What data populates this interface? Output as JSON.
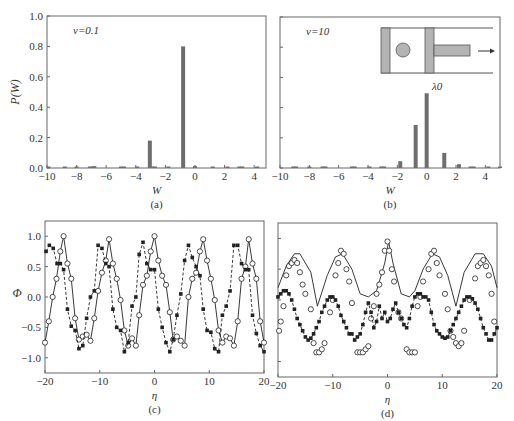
{
  "figure": {
    "panels": [
      "(a)",
      "(b)",
      "(c)",
      "(d)"
    ]
  },
  "chart_data": [
    {
      "id": "a",
      "type": "bar",
      "caption": "(a)",
      "annotation": "ν=0.1",
      "xlabel": "W",
      "ylabel": "P(W)",
      "xlim": [
        -10,
        4.8
      ],
      "ylim": [
        0,
        1.0
      ],
      "xticks": [
        -10,
        -8,
        -6,
        -4,
        -2,
        0,
        2,
        4
      ],
      "yticks": [
        0.0,
        0.2,
        0.4,
        0.6,
        0.8,
        1.0
      ],
      "ytick_labels": [
        "0.0",
        "0.2",
        "0.4",
        "0.6",
        "0.8",
        "1.0"
      ],
      "bar_color": "#6e6e6e",
      "x": [
        -9.9,
        -8.8,
        -8.0,
        -7.1,
        -6.9,
        -6.8,
        -5.0,
        -4.8,
        -3.9,
        -3.05,
        -2.9,
        -2.7,
        -1.8,
        -0.8,
        0.0,
        1.2,
        2.2,
        3.0,
        3.2,
        4.2
      ],
      "values": [
        0.003,
        0.003,
        0.003,
        0.006,
        0.01,
        0.012,
        0.003,
        0.003,
        0.003,
        0.18,
        0.006,
        0.004,
        0.003,
        0.8,
        0.012,
        0.003,
        0.003,
        0.003,
        0.003,
        0.003
      ]
    },
    {
      "id": "b",
      "type": "bar",
      "caption": "(b)",
      "annotation": "ν=10",
      "inset_label": "λ0",
      "xlabel": "W",
      "ylabel": "",
      "xlim": [
        -10,
        5
      ],
      "ylim": [
        0,
        1.0
      ],
      "xticks": [
        -10,
        -8,
        -6,
        -4,
        -2,
        0,
        2,
        4
      ],
      "yticks": [
        0.0,
        0.2,
        0.4,
        0.6,
        0.8,
        1.0
      ],
      "bar_color": "#6e6e6e",
      "x": [
        -9.1,
        -8.9,
        -8.0,
        -7.1,
        -6.9,
        -5.1,
        -4.9,
        -3.9,
        -3.1,
        -2.9,
        -1.8,
        -0.75,
        0.0,
        1.2,
        2.2,
        3.0,
        3.2,
        4.2,
        5.0
      ],
      "values": [
        0.004,
        0.004,
        0.004,
        0.004,
        0.004,
        0.004,
        0.004,
        0.01,
        0.004,
        0.004,
        0.045,
        0.285,
        0.495,
        0.1,
        0.025,
        0.004,
        0.004,
        0.004,
        0.004
      ]
    },
    {
      "id": "c",
      "type": "line",
      "caption": "(c)",
      "xlabel": "η",
      "ylabel": "Φ",
      "xlim": [
        -20,
        20
      ],
      "ylim": [
        -1.25,
        1.25
      ],
      "xticks": [
        -20,
        -10,
        0,
        10,
        20
      ],
      "yticks": [
        -1.0,
        -0.5,
        0.0,
        0.5,
        1.0
      ],
      "ytick_labels": [
        "−1.0",
        "−0.5",
        "0.0",
        "0.5",
        "1.0"
      ],
      "series": [
        {
          "name": "solid-circles",
          "style": "solid",
          "marker": "circle",
          "x": [
            -20,
            -19.3,
            -18.6,
            -17.9,
            -17.2,
            -16.6,
            -15.9,
            -15.2,
            -14.5,
            -13.8,
            -13.1,
            -12.4,
            -11.7,
            -11.0,
            -10.3,
            -9.6,
            -8.9,
            -8.3,
            -7.6,
            -6.9,
            -6.2,
            -5.5,
            -4.8,
            -4.1,
            -3.4,
            -2.8,
            -2.1,
            -1.4,
            -0.7,
            0.0,
            0.7,
            1.4,
            2.1,
            2.8,
            3.4,
            4.1,
            4.8,
            5.5,
            6.2,
            6.9,
            7.6,
            8.3,
            8.9,
            9.6,
            10.3,
            11.0,
            11.7,
            12.4,
            13.1,
            13.8,
            14.5,
            15.2,
            15.9,
            16.6,
            17.2,
            17.9,
            18.6,
            19.3,
            20.0
          ],
          "values": [
            -0.75,
            -0.4,
            0.0,
            0.3,
            0.75,
            1.0,
            0.55,
            0.3,
            -0.35,
            -0.7,
            -0.65,
            -0.62,
            -0.72,
            -0.35,
            0.1,
            0.4,
            0.6,
            0.95,
            0.55,
            0.3,
            -0.05,
            -0.55,
            -0.8,
            -0.68,
            -0.8,
            -0.3,
            0.2,
            0.35,
            0.75,
            1.0,
            0.6,
            0.35,
            0.2,
            -0.25,
            -0.7,
            -0.65,
            -0.72,
            -0.8,
            0.0,
            0.3,
            0.4,
            0.75,
            0.95,
            0.6,
            0.3,
            -0.05,
            -0.55,
            -0.75,
            -0.65,
            -0.68,
            -0.8,
            -0.4,
            0.3,
            0.5,
            0.95,
            0.55,
            0.3,
            -0.4,
            -0.75
          ]
        },
        {
          "name": "dashed-stars",
          "style": "dashed",
          "marker": "star",
          "x": [
            -19.8,
            -19.2,
            -18.5,
            -17.8,
            -17.2,
            -16.6,
            -15.9,
            -15.2,
            -14.5,
            -13.8,
            -13.1,
            -12.4,
            -11.7,
            -11.0,
            -10.3,
            -9.6,
            -8.9,
            -8.3,
            -7.6,
            -6.9,
            -6.2,
            -5.5,
            -4.8,
            -4.1,
            -3.4,
            -2.8,
            -2.1,
            -1.4,
            -0.7,
            0.0,
            0.7,
            1.4,
            2.1,
            2.8,
            3.4,
            4.1,
            4.8,
            5.5,
            6.2,
            6.9,
            7.6,
            8.3,
            8.9,
            9.6,
            10.3,
            11.0,
            11.7,
            12.4,
            13.1,
            13.8,
            14.5,
            15.2,
            15.9,
            16.6,
            17.2,
            17.9,
            18.6,
            19.3,
            20.0
          ],
          "values": [
            0.75,
            0.85,
            0.8,
            0.55,
            0.55,
            0.45,
            -0.2,
            -0.48,
            -0.55,
            -0.85,
            -0.8,
            -0.35,
            0.0,
            0.1,
            0.85,
            0.8,
            0.55,
            0.5,
            -0.2,
            -0.5,
            -0.55,
            -0.9,
            -0.75,
            -0.15,
            0.0,
            0.7,
            0.9,
            0.55,
            0.45,
            0.45,
            -0.2,
            -0.5,
            -0.75,
            -0.9,
            -0.7,
            -0.3,
            0.05,
            0.6,
            0.85,
            0.65,
            0.5,
            0.35,
            -0.2,
            -0.55,
            -0.58,
            -0.85,
            -0.9,
            -0.3,
            -0.15,
            0.1,
            0.85,
            0.85,
            0.55,
            0.45,
            0.45,
            -0.3,
            -0.6,
            -0.8,
            -0.9
          ]
        }
      ]
    },
    {
      "id": "d",
      "type": "line",
      "caption": "(d)",
      "xlabel": "η",
      "ylabel": "",
      "xlim": [
        -20,
        20
      ],
      "ylim": [
        -1.25,
        1.25
      ],
      "xticks": [
        -20,
        -10,
        0,
        10,
        20
      ],
      "yticks": [
        -1.0,
        -0.5,
        0.0,
        0.5,
        1.0
      ],
      "series": [
        {
          "name": "solid-line",
          "style": "solid",
          "marker": "none",
          "x": [
            -20,
            -18.5,
            -17,
            -16,
            -14,
            -12.8,
            -11,
            -9.5,
            -8.2,
            -6.5,
            -5,
            -3.5,
            -2,
            -0.5,
            0.2,
            1,
            2.5,
            4,
            5,
            6.5,
            8.2,
            9.5,
            11,
            12.5,
            14,
            16,
            17.5,
            19,
            20
          ],
          "values": [
            0.2,
            0.55,
            0.75,
            0.75,
            0.45,
            -0.1,
            0.4,
            0.7,
            0.75,
            0.5,
            0.1,
            0.05,
            0.15,
            0.6,
            0.95,
            0.6,
            0.1,
            0.05,
            0.15,
            0.5,
            0.75,
            0.7,
            0.4,
            -0.1,
            0.45,
            0.75,
            0.75,
            0.55,
            0.2
          ]
        },
        {
          "name": "circles",
          "style": "none",
          "marker": "circle",
          "x": [
            -19.8,
            -19.5,
            -19,
            -18.5,
            -18,
            -17.5,
            -17,
            -16.5,
            -16,
            -15.5,
            -15,
            -14,
            -13.5,
            -13,
            -12.5,
            -12,
            -11.5,
            -10.5,
            -10,
            -9.5,
            -9,
            -8.5,
            -8,
            -7.5,
            -7,
            -6.5,
            -5.5,
            -5,
            -4.5,
            -4,
            -3.5,
            -3,
            -2.5,
            -2,
            -1.5,
            -1,
            -0.5,
            0,
            0.3,
            0.8,
            1.2,
            2,
            2.5,
            3.5,
            4,
            4.5,
            5,
            5.5,
            6,
            6.5,
            7.5,
            8,
            8.5,
            9,
            9.5,
            10.5,
            11,
            11.5,
            12,
            12.5,
            13,
            13.5,
            14,
            15,
            16,
            16.5,
            17,
            17.5,
            18,
            18.5,
            19,
            19.5
          ],
          "values": [
            -0.5,
            -0.35,
            -0.1,
            0.4,
            0.55,
            0.6,
            0.65,
            0.6,
            0.45,
            0.25,
            0.1,
            -0.15,
            -0.7,
            -0.85,
            -0.85,
            -0.8,
            -0.7,
            -0.2,
            0.0,
            0.4,
            0.6,
            0.8,
            0.75,
            0.5,
            0.3,
            -0.05,
            -0.85,
            -0.85,
            -0.85,
            -0.8,
            -0.75,
            -0.3,
            -0.1,
            0.1,
            0.25,
            0.45,
            0.8,
            0.95,
            0.8,
            0.5,
            0.3,
            -0.2,
            -0.3,
            -0.8,
            -0.85,
            -0.85,
            -0.85,
            -0.1,
            0.05,
            0.3,
            0.5,
            0.75,
            0.8,
            0.6,
            0.4,
            0.1,
            -0.15,
            -0.5,
            -0.6,
            -0.7,
            -0.75,
            -0.7,
            -0.5,
            0.0,
            0.35,
            0.55,
            0.6,
            0.65,
            0.55,
            0.4,
            0.1,
            -0.35
          ]
        },
        {
          "name": "dashed-stars",
          "style": "dashed",
          "marker": "star",
          "x": [
            -20,
            -19.5,
            -19,
            -18.5,
            -18,
            -17.5,
            -17,
            -16.5,
            -16,
            -15.5,
            -15,
            -14.5,
            -14,
            -13.5,
            -13,
            -12.5,
            -12,
            -11.5,
            -11,
            -10.5,
            -10,
            -9.5,
            -9,
            -8.5,
            -8,
            -7.5,
            -7,
            -6.5,
            -6,
            -5.5,
            -5,
            -4.5,
            -4,
            -3.5,
            -3,
            -2.5,
            -2,
            -1.5,
            -1,
            -0.5,
            0,
            0.5,
            1,
            1.5,
            2,
            2.5,
            3,
            3.5,
            4,
            4.5,
            5,
            5.5,
            6,
            6.5,
            7,
            7.5,
            8,
            8.5,
            9,
            9.5,
            10,
            10.5,
            11,
            11.5,
            12,
            12.5,
            13,
            13.5,
            14,
            14.5,
            15,
            15.5,
            16,
            16.5,
            17,
            17.5,
            18,
            18.5,
            19,
            19.5,
            20
          ],
          "values": [
            0.05,
            0.1,
            0.15,
            0.15,
            0.1,
            0.0,
            -0.15,
            -0.3,
            -0.4,
            -0.5,
            -0.6,
            -0.65,
            -0.62,
            -0.55,
            -0.45,
            -0.35,
            -0.2,
            -0.1,
            0.0,
            0.05,
            0.05,
            0.0,
            -0.1,
            -0.25,
            -0.35,
            -0.45,
            -0.55,
            -0.55,
            -0.65,
            -0.6,
            -0.55,
            -0.4,
            -0.2,
            -0.05,
            -0.2,
            -0.45,
            -0.35,
            -0.1,
            -0.3,
            -0.2,
            -0.35,
            -0.3,
            -0.15,
            -0.05,
            -0.2,
            -0.3,
            -0.4,
            -0.45,
            -0.3,
            -0.1,
            0.05,
            0.1,
            0.1,
            0.05,
            0.05,
            0.0,
            -0.2,
            -0.4,
            -0.5,
            -0.55,
            -0.6,
            -0.62,
            -0.6,
            -0.5,
            -0.4,
            -0.3,
            -0.2,
            -0.1,
            0.0,
            0.05,
            0.05,
            0.02,
            -0.05,
            -0.15,
            -0.3,
            -0.45,
            -0.55,
            -0.65,
            -0.65,
            -0.55,
            -0.45
          ]
        }
      ]
    }
  ],
  "inset": {
    "label": "λ0",
    "fill": "#b4b4b4",
    "arrow": "right"
  }
}
